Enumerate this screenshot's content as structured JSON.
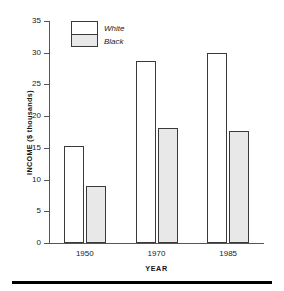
{
  "chart_data": {
    "type": "bar",
    "title": "",
    "xlabel": "YEAR",
    "ylabel": "INCOME ($ thousands)",
    "categories": [
      "1950",
      "1970",
      "1985"
    ],
    "series": [
      {
        "name": "White",
        "values": [
          15.3,
          28.7,
          30.0
        ]
      },
      {
        "name": "Black",
        "values": [
          9.0,
          18.1,
          17.6
        ]
      }
    ],
    "ylim": [
      0,
      35
    ],
    "yticks": [
      0,
      5,
      10,
      15,
      20,
      25,
      30,
      35
    ],
    "ytick_labels": [
      "0",
      "5",
      "10",
      "15",
      "20",
      "25",
      "30",
      "35"
    ],
    "grid": false,
    "legend_position": "top-left",
    "legend_entries": [
      "White",
      "Black"
    ]
  },
  "axes": {
    "y_title": "INCOME ($ thousands)",
    "x_title": "YEAR"
  },
  "legend": {
    "white_label": "White",
    "black_label": "Black"
  }
}
